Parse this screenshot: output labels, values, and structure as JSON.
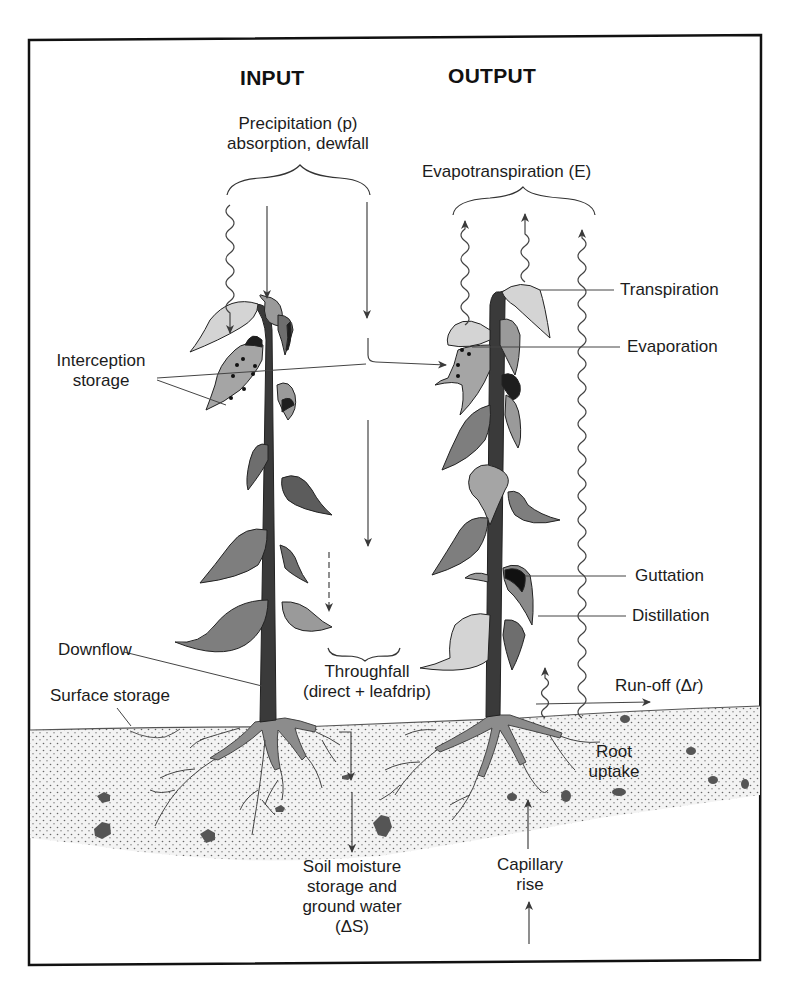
{
  "headers": {
    "input": "INPUT",
    "output": "OUTPUT"
  },
  "labels": {
    "precipitation_line1": "Precipitation (p)",
    "precipitation_line2": "absorption, dewfall",
    "evapotranspiration": "Evapotranspiration (E)",
    "transpiration": "Transpiration",
    "evaporation": "Evaporation",
    "interception_line1": "Interception",
    "interception_line2": "storage",
    "guttation": "Guttation",
    "distillation": "Distillation",
    "downflow": "Downflow",
    "throughfall_line1": "Throughfall",
    "throughfall_line2": "(direct + leafdrip)",
    "runoff_prefix": "Run-off (Δ",
    "runoff_var": "r",
    "runoff_suffix": ")",
    "surface_storage": "Surface storage",
    "root_line1": "Root",
    "root_line2": "uptake",
    "soil_line1": "Soil moisture",
    "soil_line2": "storage and",
    "soil_line3": "ground water",
    "soil_line4": "(ΔS)",
    "capillary_line1": "Capillary",
    "capillary_line2": "rise"
  },
  "colors": {
    "stem": "#3a3a3a",
    "leaf_dark": "#6e6e6e",
    "leaf_mid": "#9a9a9a",
    "leaf_light": "#d4d4d4",
    "leaf_black": "#1e1e1e",
    "soil": "#f1f1f1",
    "roots": "#8c8c8c",
    "line": "#3a3a3a"
  }
}
